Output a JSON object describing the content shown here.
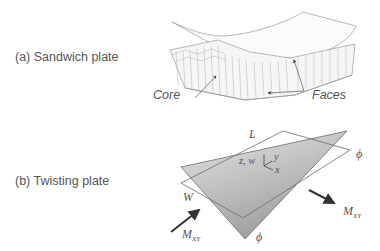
{
  "panels": [
    {
      "id": "a",
      "caption": "(a) Sandwich plate",
      "labels": {
        "core": "Core",
        "faces": "Faces"
      }
    },
    {
      "id": "b",
      "caption": "(b) Twisting plate",
      "labels": {
        "length": "L",
        "width": "W",
        "axes_zw": "z, w",
        "axis_y": "y",
        "axis_x": "x",
        "angle_right": "ϕ",
        "angle_bottom": "ϕ",
        "moment_left": "M",
        "moment_left_sub": "XY",
        "moment_right": "M",
        "moment_right_sub": "XY"
      }
    }
  ],
  "colors": {
    "text": "#555555",
    "line": "#777777",
    "shade_light": "#e4e4e4",
    "shade_dark": "#9a9a9a",
    "arrow": "#333333"
  }
}
